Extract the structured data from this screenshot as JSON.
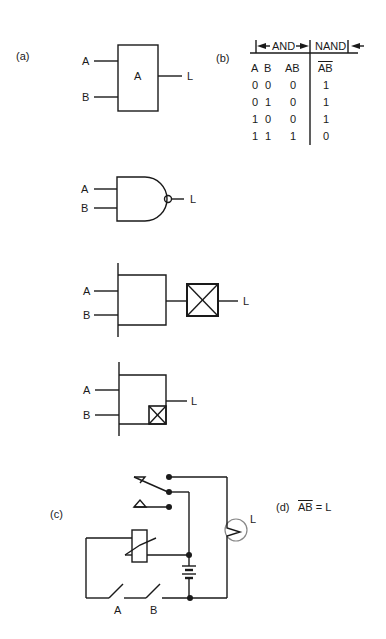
{
  "panels": {
    "a": {
      "label": "(a)",
      "symbol1": {
        "inputs": [
          "A",
          "B"
        ],
        "box_text": "A",
        "output": "L"
      },
      "symbol2": {
        "inputs": [
          "A",
          "B"
        ],
        "output": "L",
        "type": "NAND gate (distinctive shape)"
      },
      "symbol3": {
        "inputs": [
          "A",
          "B"
        ],
        "output": "L",
        "type": "AND block with inverter box"
      },
      "symbol4": {
        "inputs": [
          "A",
          "B"
        ],
        "output": "L",
        "type": "AND block with internal inverter box"
      }
    },
    "b": {
      "label": "(b)",
      "group_and": "AND",
      "group_nand": "NAND",
      "headers": [
        "A",
        "B",
        "AB",
        "AB"
      ],
      "rows": [
        [
          "0",
          "0",
          "0",
          "1"
        ],
        [
          "0",
          "1",
          "0",
          "1"
        ],
        [
          "1",
          "0",
          "0",
          "1"
        ],
        [
          "1",
          "1",
          "1",
          "0"
        ]
      ]
    },
    "c": {
      "label": "(c)",
      "switches": [
        "A",
        "B"
      ],
      "lamp": "L"
    },
    "d": {
      "label": "(d)",
      "expr_over": "AB",
      "expr_rest": " = L"
    }
  }
}
